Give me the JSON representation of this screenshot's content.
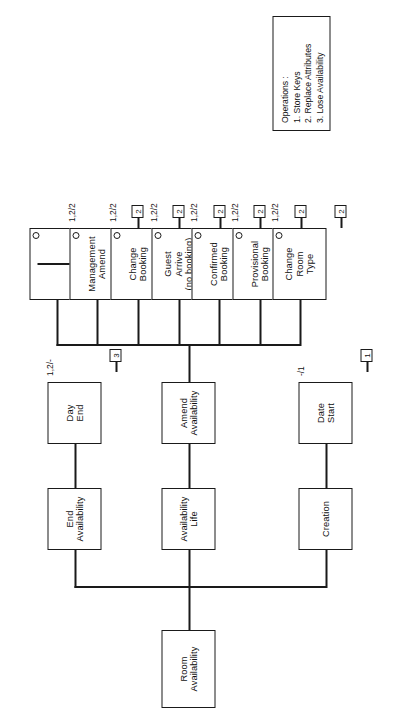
{
  "diagram": {
    "type": "entity-life-history",
    "root": {
      "label": "Room\nAvailability",
      "line1": "Room",
      "line2": "Availability"
    },
    "branches": {
      "creation": {
        "label": "Creation"
      },
      "availability_life": {
        "line1": "Availability",
        "line2": "Life"
      },
      "end_availability": {
        "line1": "End",
        "line2": "Availability"
      },
      "amend_availability": {
        "line1": "Amend",
        "line2": "Availability"
      }
    },
    "leaves": [
      {
        "id": "date-start",
        "line1": "Date",
        "line2": "Start",
        "marker": false,
        "effect": "-/1",
        "operation": "1"
      },
      {
        "id": "day-end",
        "line1": "Day",
        "line2": "End",
        "marker": false,
        "effect": "1,2/-",
        "operation": "3"
      },
      {
        "id": "change-room-type",
        "line1": "Change",
        "line2": "Room",
        "line3": "Type",
        "marker": true,
        "effect": "1,2/2",
        "operation": "2"
      },
      {
        "id": "provisional-booking",
        "line1": "Provisional",
        "line2": "Booking",
        "marker": true,
        "effect": "1,2/2",
        "operation": "2"
      },
      {
        "id": "confirmed-booking",
        "line1": "Confirmed",
        "line2": "Booking",
        "marker": true,
        "effect": "1,2/2",
        "operation": "2"
      },
      {
        "id": "guest-arrive",
        "line1": "Guest",
        "line2": "Arrive",
        "line3": "(no booking)",
        "marker": true,
        "effect": "1,2/2",
        "operation": "2"
      },
      {
        "id": "change-booking",
        "line1": "Change",
        "line2": "Booking",
        "marker": true,
        "effect": "1,2/2",
        "operation": "2"
      },
      {
        "id": "management-amend",
        "line1": "Management",
        "line2": "Amend",
        "marker": true,
        "effect": "1,2/2",
        "operation": "2"
      },
      {
        "id": "null-leaf",
        "line1": "",
        "line2": "",
        "marker": true,
        "effect": "",
        "operation": ""
      }
    ],
    "legend": {
      "title": "Operations :",
      "items": [
        "1. Store Keys",
        "2. Replace Attributes",
        "3. Lose Availability"
      ]
    },
    "colors": {
      "stroke": "#1a1a1a",
      "background": "#ffffff",
      "text": "#111111"
    }
  }
}
